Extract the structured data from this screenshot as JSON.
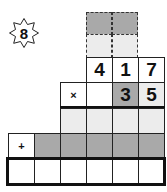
{
  "badge": {
    "icon": "eight-point-star-icon",
    "label": "8"
  },
  "colors": {
    "dark_cell": "#a9a9a9",
    "light_cell": "#e9e9e9",
    "white_cell": "#ffffff",
    "line": "#111111"
  },
  "carry_rows": {
    "top": [
      "",
      ""
    ],
    "bottom": [
      "",
      ""
    ]
  },
  "multiplicand": [
    "4",
    "1",
    "7"
  ],
  "multiplier_row": {
    "operator": "×",
    "digits": [
      "",
      "3",
      "5"
    ]
  },
  "partial_row_1": [
    "",
    "",
    "",
    ""
  ],
  "partial_row_2": {
    "operator": "+",
    "digits": [
      "",
      "",
      "",
      "",
      ""
    ]
  },
  "answer_row": [
    "",
    "",
    "",
    "",
    "",
    ""
  ]
}
